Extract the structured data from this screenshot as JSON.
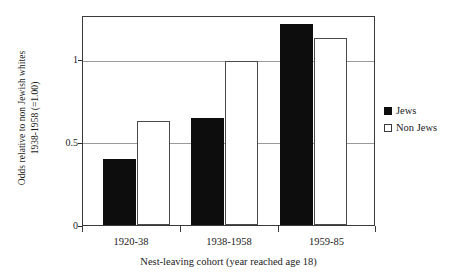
{
  "chart_data": {
    "type": "bar",
    "title": "",
    "categories": [
      "1920-38",
      "1938-1958",
      "1959-85"
    ],
    "series": [
      {
        "name": "Jews",
        "values": [
          0.4,
          0.65,
          1.22
        ],
        "color": "#0d0d0d",
        "style": "filled"
      },
      {
        "name": "Non Jews",
        "values": [
          0.63,
          1.0,
          1.14
        ],
        "color": "#ffffff",
        "style": "open"
      }
    ],
    "xlabel": "Nest-leaving cohort (year reached age 18)",
    "ylabel_line1": "Odds relative to non Jewish whites",
    "ylabel_line2": "1938-1958 (=1.00)",
    "ylim": [
      0,
      1.265
    ],
    "yticks": [
      "0",
      "0.5",
      "1"
    ],
    "ytick_values": [
      0,
      0.5,
      1
    ],
    "gridlines": [
      0.5,
      1
    ],
    "grid": true,
    "legend_position": "right-outside",
    "legend_entries": [
      "Jews",
      "Non Jews"
    ]
  }
}
